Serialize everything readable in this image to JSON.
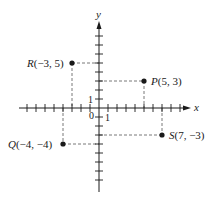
{
  "diagram": {
    "type": "coordinate-plane",
    "axes": {
      "x_label": "x",
      "y_label": "y",
      "origin_label": "0",
      "unit_x_label": "1",
      "unit_y_label": "1",
      "x_range": [
        -9,
        9
      ],
      "y_range": [
        -9,
        9
      ]
    },
    "points": [
      {
        "name": "P",
        "x": 5,
        "y": 3,
        "label": "P(5, 3)"
      },
      {
        "name": "R",
        "x": -3,
        "y": 5,
        "label": "R(−3, 5)"
      },
      {
        "name": "Q",
        "x": -4,
        "y": -4,
        "label": "Q(−4, −4)"
      },
      {
        "name": "S",
        "x": 7,
        "y": -3,
        "label": "S(7, −3)"
      }
    ],
    "colors": {
      "ink": "#1a1a1a",
      "dash": "#555555",
      "background": "#ffffff"
    }
  }
}
